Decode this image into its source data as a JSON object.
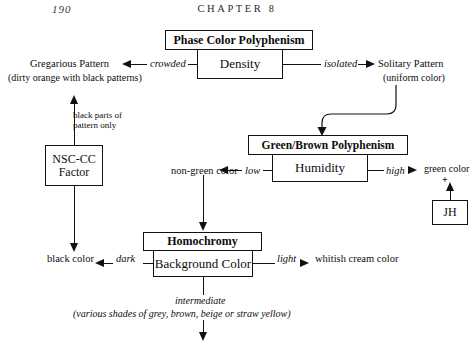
{
  "page": {
    "folio": "190",
    "chapter_title": "CHAPTER 8"
  },
  "boxes": {
    "phase_color_polyphenism": "Phase Color Polyphenism",
    "density": "Density",
    "green_brown_polyphenism": "Green/Brown Polyphenism",
    "humidity": "Humidity",
    "homochromy": "Homochromy",
    "background_color": "Background Color",
    "nsc_cc_line1": "NSC-CC",
    "nsc_cc_line2": "Factor",
    "jh": "JH"
  },
  "labels": {
    "gregarious_pattern": "Gregarious Pattern",
    "gregarious_pattern_detail": "(dirty orange with black patterns)",
    "solitary_pattern": "Solitary Pattern",
    "solitary_pattern_detail": "(uniform color)",
    "crowded": "crowded",
    "isolated": "isolated",
    "black_parts_line1": "black parts of",
    "black_parts_line2": "pattern only",
    "non_green_color": "non-green color",
    "low": "low",
    "high": "high",
    "green_color": "green color",
    "plus": "+",
    "black_color": "black color",
    "dark": "dark",
    "light": "light",
    "whitish_cream_color": "whitish cream color",
    "intermediate": "intermediate",
    "intermediate_detail": "(various shades of grey, brown, beige or straw yellow)"
  },
  "style": {
    "ink": "#111111",
    "paper": "#ffffff"
  }
}
